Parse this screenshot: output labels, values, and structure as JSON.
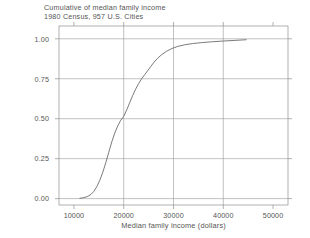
{
  "chart_data": {
    "type": "line",
    "title": "Cumulative of median family income",
    "subtitle": "1980 Census, 957 U.S. Cities",
    "xlabel": "Median family income (dollars)",
    "ylabel": "",
    "xlim": [
      7000,
      53000
    ],
    "ylim": [
      -0.04,
      1.08
    ],
    "xticks": [
      10000,
      20000,
      30000,
      40000,
      50000
    ],
    "xtick_labels": [
      "10000",
      "20000",
      "30000",
      "40000",
      "50000"
    ],
    "yticks": [
      0.0,
      0.25,
      0.5,
      0.75,
      1.0
    ],
    "ytick_labels": [
      "0.00",
      "0.25",
      "0.50",
      "0.75",
      "1.00"
    ],
    "grid": true,
    "grid_x_values": [
      20000,
      30000,
      40000
    ],
    "grid_y_values": [
      0.0,
      0.25,
      0.5,
      0.75,
      1.0
    ],
    "legend": null,
    "series": [
      {
        "name": "Cumulative proportion of cities",
        "x": [
          11200,
          12000,
          12800,
          13400,
          14000,
          14600,
          15200,
          15800,
          16400,
          17000,
          17600,
          18200,
          18800,
          19400,
          20000,
          20600,
          21200,
          21800,
          22400,
          23000,
          23600,
          24200,
          24800,
          25400,
          26000,
          26800,
          27600,
          28600,
          29600,
          30800,
          32200,
          33800,
          35600,
          37600,
          40000,
          42400,
          44600
        ],
        "y": [
          0.002,
          0.006,
          0.014,
          0.026,
          0.045,
          0.075,
          0.115,
          0.165,
          0.225,
          0.29,
          0.355,
          0.41,
          0.455,
          0.49,
          0.515,
          0.555,
          0.6,
          0.645,
          0.685,
          0.72,
          0.75,
          0.775,
          0.8,
          0.825,
          0.85,
          0.878,
          0.9,
          0.922,
          0.938,
          0.952,
          0.962,
          0.97,
          0.976,
          0.981,
          0.986,
          0.99,
          0.994
        ]
      }
    ]
  },
  "style": {
    "line_color": "#6b6b6b",
    "axis_color": "#8f8f8f",
    "grid_color": "#999999",
    "text_color": "#555555",
    "background": "#ffffff"
  }
}
